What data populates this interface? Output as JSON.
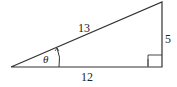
{
  "diagram": {
    "type": "right-triangle",
    "labels": {
      "hypotenuse": "13",
      "opposite": "5",
      "adjacent": "12",
      "angle": "θ"
    },
    "colors": {
      "stroke": "#333333",
      "background": "#ffffff"
    }
  }
}
